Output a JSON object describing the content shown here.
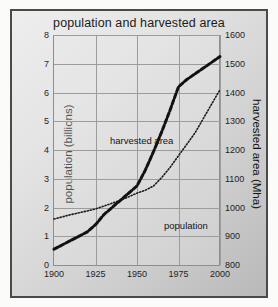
{
  "chart_data": {
    "type": "line",
    "title": "population and harvested area",
    "xlabel": "",
    "x_ticks": [
      1900,
      1925,
      1950,
      1975,
      2000
    ],
    "xlim": [
      1900,
      2000
    ],
    "grid": true,
    "legend": "inline-labels",
    "axes": [
      {
        "id": "left",
        "ylabel": "population (billions)",
        "ylim": [
          0,
          8
        ],
        "y_ticks": [
          0,
          1,
          2,
          3,
          4,
          5,
          6,
          7,
          8
        ]
      },
      {
        "id": "right",
        "ylabel": "harvested area (Mha)",
        "ylim": [
          800,
          1600
        ],
        "y_ticks": [
          800,
          900,
          1000,
          1100,
          1200,
          1300,
          1400,
          1500,
          1600
        ]
      }
    ],
    "series": [
      {
        "name": "population",
        "label": "population",
        "axis": "left",
        "unit": "billions",
        "style": "dotted",
        "color": "#1c1c1c",
        "x": [
          1900,
          1910,
          1920,
          1925,
          1930,
          1940,
          1950,
          1955,
          1960,
          1965,
          1970,
          1975,
          1980,
          1985,
          1990,
          1995,
          2000
        ],
        "values": [
          1.6,
          1.75,
          1.88,
          1.95,
          2.05,
          2.25,
          2.5,
          2.6,
          2.75,
          3.05,
          3.4,
          3.8,
          4.2,
          4.6,
          5.1,
          5.6,
          6.1
        ]
      },
      {
        "name": "harvested area",
        "label": "harvested area",
        "axis": "right",
        "unit": "Mha",
        "style": "dashed",
        "color": "#111111",
        "x": [
          1900,
          1910,
          1920,
          1925,
          1930,
          1940,
          1950,
          1955,
          1960,
          1965,
          1970,
          1975,
          1980,
          1985,
          1990,
          1995,
          2000
        ],
        "values": [
          855,
          885,
          915,
          940,
          975,
          1025,
          1075,
          1130,
          1195,
          1265,
          1340,
          1420,
          1445,
          1465,
          1485,
          1505,
          1525
        ],
        "values_left_scale": [
          0.55,
          0.85,
          1.15,
          1.4,
          1.75,
          2.25,
          2.75,
          3.3,
          3.95,
          4.65,
          5.4,
          6.2,
          6.45,
          6.65,
          6.85,
          7.05,
          7.25
        ]
      }
    ],
    "annotations": [
      {
        "text": "harvested area",
        "x": 1928,
        "y": 5.45
      },
      {
        "text": "population",
        "x": 1958,
        "y": 2.85
      }
    ]
  }
}
